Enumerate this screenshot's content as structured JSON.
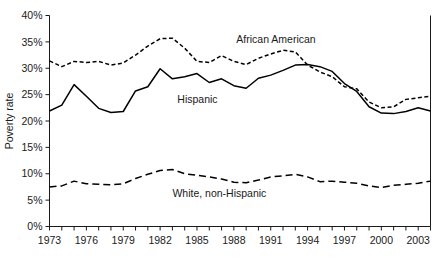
{
  "chart_data": {
    "type": "line",
    "title": "",
    "subtitle": "",
    "xlabel": "",
    "ylabel": "Poverty rate",
    "xlim": [
      1973,
      2004
    ],
    "ylim": [
      0,
      40
    ],
    "y_tick_labels": [
      "0%",
      "5%",
      "10%",
      "15%",
      "20%",
      "25%",
      "30%",
      "35%",
      "40%"
    ],
    "y_tick_values": [
      0,
      5,
      10,
      15,
      20,
      25,
      30,
      35,
      40
    ],
    "x_tick_labels": [
      "1973",
      "1976",
      "1979",
      "1982",
      "1985",
      "1988",
      "1991",
      "1994",
      "1997",
      "2000",
      "2003"
    ],
    "x_tick_values": [
      1973,
      1976,
      1979,
      1982,
      1985,
      1988,
      1991,
      1994,
      1997,
      2000,
      2003
    ],
    "x_minor_ticks": [
      1973,
      1974,
      1975,
      1976,
      1977,
      1978,
      1979,
      1980,
      1981,
      1982,
      1983,
      1984,
      1985,
      1986,
      1987,
      1988,
      1989,
      1990,
      1991,
      1992,
      1993,
      1994,
      1995,
      1996,
      1997,
      1998,
      1999,
      2000,
      2001,
      2002,
      2003,
      2004
    ],
    "grid": false,
    "legend_position": "inline-annotations",
    "x": [
      1973,
      1974,
      1975,
      1976,
      1977,
      1978,
      1979,
      1980,
      1981,
      1982,
      1983,
      1984,
      1985,
      1986,
      1987,
      1988,
      1989,
      1990,
      1991,
      1992,
      1993,
      1994,
      1995,
      1996,
      1997,
      1998,
      1999,
      2000,
      2001,
      2002,
      2003,
      2004
    ],
    "series": [
      {
        "name": "African American",
        "line_style": "short-dash",
        "color": "#000000",
        "label_text": "African American",
        "values": [
          31.4,
          30.3,
          31.3,
          31.1,
          31.3,
          30.6,
          31.0,
          32.5,
          34.2,
          35.6,
          35.7,
          33.8,
          31.3,
          31.1,
          32.4,
          31.3,
          30.7,
          31.9,
          32.7,
          33.4,
          33.1,
          30.6,
          29.3,
          28.4,
          26.5,
          26.1,
          23.6,
          22.5,
          22.7,
          24.1,
          24.4,
          24.7
        ]
      },
      {
        "name": "Hispanic",
        "line_style": "solid",
        "color": "#000000",
        "label_text": "Hispanic",
        "values": [
          21.9,
          23.0,
          26.9,
          24.7,
          22.4,
          21.6,
          21.8,
          25.7,
          26.5,
          29.9,
          28.0,
          28.4,
          29.0,
          27.3,
          28.0,
          26.7,
          26.2,
          28.1,
          28.7,
          29.6,
          30.6,
          30.7,
          30.3,
          29.4,
          27.1,
          25.6,
          22.7,
          21.5,
          21.4,
          21.8,
          22.5,
          21.9
        ]
      },
      {
        "name": "White, non-Hispanic",
        "line_style": "long-dash",
        "color": "#000000",
        "label_text": "White, non-Hispanic",
        "values": [
          7.5,
          7.7,
          8.6,
          8.1,
          8.0,
          7.9,
          8.1,
          9.1,
          9.9,
          10.6,
          10.8,
          10.0,
          9.7,
          9.4,
          9.0,
          8.4,
          8.3,
          8.8,
          9.4,
          9.6,
          9.9,
          9.4,
          8.5,
          8.6,
          8.4,
          8.2,
          7.7,
          7.4,
          7.8,
          8.0,
          8.2,
          8.6
        ]
      }
    ],
    "annotations": [
      {
        "text": "African American",
        "x": 1988.2,
        "y": 34.8
      },
      {
        "text": "Hispanic",
        "x": 1983.4,
        "y": 23.4
      },
      {
        "text": "White, non-Hispanic",
        "x": 1983.0,
        "y": 5.6
      }
    ]
  }
}
